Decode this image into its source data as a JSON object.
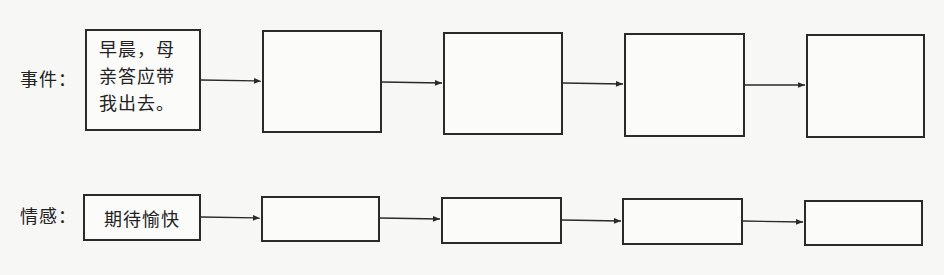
{
  "rows": {
    "event": {
      "label": "事件：",
      "boxes": [
        {
          "text": "早晨，母亲答应带我出去。",
          "lines": [
            "早晨，母",
            "亲答应带",
            "我出去。"
          ]
        },
        {
          "text": ""
        },
        {
          "text": ""
        },
        {
          "text": ""
        },
        {
          "text": ""
        }
      ]
    },
    "emotion": {
      "label": "情感：",
      "boxes": [
        {
          "text": "期待愉快"
        },
        {
          "text": ""
        },
        {
          "text": ""
        },
        {
          "text": ""
        },
        {
          "text": ""
        }
      ]
    }
  },
  "colors": {
    "stroke": "#2a2a2a",
    "background": "#f7f7f5"
  }
}
